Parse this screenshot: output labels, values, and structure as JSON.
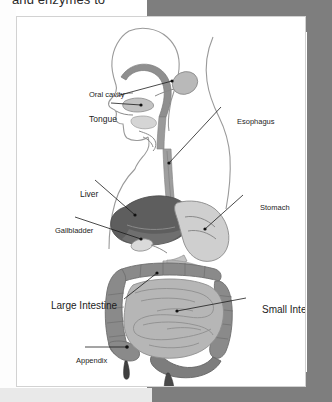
{
  "page": {
    "header_text_cropped": "and enzymes to",
    "background_colors": {
      "page": "#ffffff",
      "band_gray": "#7e7e7e",
      "band_light": "#e9e9e9",
      "frame_border": "#d2d2d2"
    }
  },
  "figure": {
    "palette": {
      "outline": "#8a8a8a",
      "liver": "#5a5a5a",
      "stomach": "#c9c9c9",
      "small_intestine": "#b4b4b4",
      "large_intestine": "#7d7d7d",
      "esophagus": "#9a9a9a",
      "gallbladder": "#dedede",
      "appendix": "#4a4a4a",
      "leader_line": "#1c1c1c"
    },
    "labels": [
      {
        "id": "oral-cavity",
        "text": "Oral cavity",
        "size": "sm"
      },
      {
        "id": "tongue",
        "text": "Tongue",
        "size": "md"
      },
      {
        "id": "esophagus",
        "text": "Esophagus",
        "size": "sm"
      },
      {
        "id": "liver",
        "text": "Liver",
        "size": "md"
      },
      {
        "id": "gallbladder",
        "text": "Gallbladder",
        "size": "sm"
      },
      {
        "id": "stomach",
        "text": "Stomach",
        "size": "sm"
      },
      {
        "id": "large-intestine",
        "text": "Large Intestine",
        "size": "lg"
      },
      {
        "id": "small-intestine",
        "text": "Small Intesine",
        "size": "lg"
      },
      {
        "id": "appendix",
        "text": "Appendix",
        "size": "sm"
      }
    ]
  }
}
